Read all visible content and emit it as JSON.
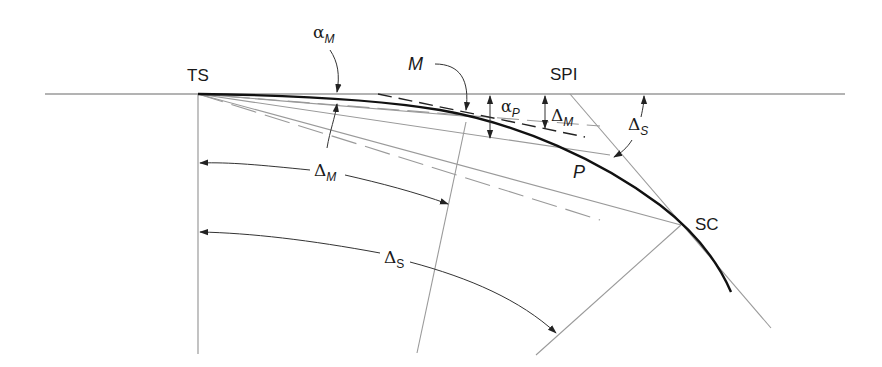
{
  "diagram": {
    "colors": {
      "curve": "#111111",
      "construction_line": "#9a9a9a",
      "dimension_line": "#333333",
      "text": "#1a1a1a",
      "background": "#ffffff"
    },
    "points": {
      "ts": "TS",
      "spi": "SPI",
      "sc": "SC",
      "m": "M",
      "p": "P"
    },
    "angles": {
      "alpha_m": {
        "symbol": "α",
        "subscript": "M"
      },
      "alpha_p": {
        "symbol": "α",
        "subscript": "P"
      },
      "delta_m_top": {
        "symbol": "Δ",
        "subscript": "M"
      },
      "delta_s_top": {
        "symbol": "Δ",
        "subscript": "S"
      },
      "delta_m_arc": {
        "symbol": "Δ",
        "subscript": "M"
      },
      "delta_s_arc": {
        "symbol": "Δ",
        "subscript": "S"
      }
    },
    "elements": [
      "tangent line through TS and SPI",
      "spiral curve from TS to SC",
      "vertical radial line at TS",
      "chord rays from TS to M, P and SC",
      "dashed tangent lines at M and P",
      "tangent at SC through SPI",
      "radial lines at M and SC",
      "angle dimension arcs"
    ]
  }
}
